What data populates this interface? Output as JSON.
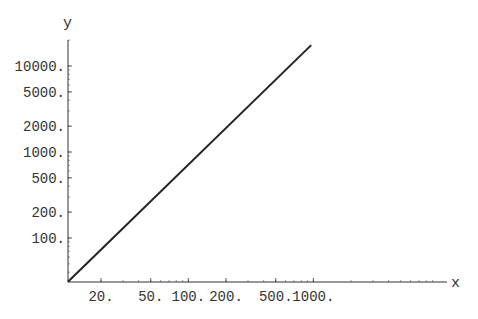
{
  "chart_data": {
    "type": "line",
    "title": "",
    "xlabel": "x",
    "ylabel": "y",
    "x_scale": "log",
    "y_scale": "log",
    "grid": false,
    "legend": null,
    "xlim": [
      10.9,
      1100
    ],
    "ylim": [
      31,
      25000
    ],
    "x_ticks": [
      20,
      50,
      100,
      200,
      500,
      1000
    ],
    "x_tick_labels": [
      "20.",
      "50.",
      "100.",
      "200.",
      "500.",
      "1000."
    ],
    "y_ticks": [
      100,
      200,
      500,
      1000,
      2000,
      5000,
      10000
    ],
    "y_tick_labels": [
      "100.",
      "200.",
      "500.",
      "1000.",
      "2000.",
      "5000.",
      "10000."
    ],
    "series": [
      {
        "name": "y(x)",
        "note": "straight line on log-log axes; endpoints read from pixels, approximate",
        "x": [
          10.9,
          960
        ],
        "y": [
          31,
          17500
        ],
        "color": "#222222"
      }
    ]
  },
  "layout": {
    "origin_px": [
      68,
      282
    ],
    "x_axis_end_px": 447,
    "y_axis_top_px": 40,
    "x_px_per_decade": 125,
    "y_px_per_decade": 86,
    "x_ref": {
      "value": 20,
      "px": 101
    },
    "y_ref": {
      "value": 10000,
      "px": 66
    }
  },
  "colors": {
    "axis": "#333333",
    "line": "#222222",
    "background": "#ffffff"
  }
}
